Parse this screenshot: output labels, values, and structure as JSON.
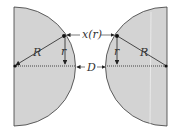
{
  "diagram": {
    "title": "",
    "labels": {
      "left_radius": "R",
      "right_radius": "R",
      "left_small_r": "r",
      "right_small_r": "r",
      "gap_function": "x(r)",
      "separation": "D"
    },
    "colors": {
      "fill": "#d3d3d3",
      "stroke": "#3a3a3a",
      "background": "#ffffff"
    },
    "shapes": [
      {
        "name": "left-sphere-section",
        "center": [
          14,
          66
        ],
        "radius": 61
      },
      {
        "name": "right-sphere-section",
        "center": [
          167,
          66
        ],
        "radius": 61
      }
    ]
  }
}
